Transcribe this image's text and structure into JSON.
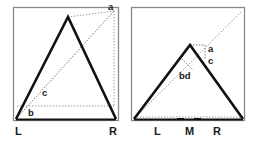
{
  "figure": {
    "width": 255,
    "height": 141,
    "background": "#ffffff",
    "stroke_bold": "#111111",
    "stroke_frame": "#8a8a8a",
    "stroke_dotted": "#9a9a9a"
  },
  "panels": [
    {
      "id": "left-panel",
      "name": "left-diagram-panel",
      "frame": {
        "x": 13,
        "y": 7,
        "width": 105,
        "height": 113
      },
      "bold_shape": "M16,119 L68,17 L116,119",
      "baseline": "M16,119 L116,119",
      "dotted_lines": [
        {
          "name": "diagonal-l-to-a",
          "d": "M16,119 L114,11"
        },
        {
          "name": "horizontal-b-level",
          "d": "M17,105 L114,105"
        },
        {
          "name": "vertical-right-edge",
          "d": "M114,11 L114,105"
        },
        {
          "name": "horizontal-top-a",
          "d": "M68,17 L114,11"
        }
      ],
      "point_labels": [
        {
          "name": "label-a",
          "text": "a",
          "x": 108,
          "y": 10
        },
        {
          "name": "label-c",
          "text": "c",
          "x": 42,
          "y": 96
        },
        {
          "name": "label-b",
          "text": "b",
          "x": 28,
          "y": 116
        }
      ],
      "axis_labels": [
        {
          "name": "axis-label-L",
          "text": "L",
          "x": 15,
          "y": 134
        },
        {
          "name": "axis-label-R",
          "text": "R",
          "x": 109,
          "y": 134
        }
      ],
      "ticks": []
    },
    {
      "id": "right-panel",
      "name": "right-diagram-panel",
      "frame": {
        "x": 131,
        "y": 7,
        "width": 114,
        "height": 113
      },
      "bold_shape": "M134,119 L190,45 L243,119",
      "baseline": "M134,119 L243,119",
      "dotted_lines": [
        {
          "name": "diagonal-l-to-corner",
          "d": "M134,119 L242,11"
        },
        {
          "name": "apex-box-vertical",
          "d": "M204,45 L204,59"
        },
        {
          "name": "apex-box-horizontal",
          "d": "M190,45 L204,45"
        },
        {
          "name": "bd-marker",
          "d": "M181,56 L192,68"
        }
      ],
      "point_labels": [
        {
          "name": "label-a",
          "text": "a",
          "x": 208,
          "y": 52
        },
        {
          "name": "label-c",
          "text": "c",
          "x": 208,
          "y": 64
        },
        {
          "name": "label-bd",
          "text": "bd",
          "x": 181,
          "y": 78
        }
      ],
      "axis_labels": [
        {
          "name": "axis-label-L",
          "text": "L",
          "x": 155,
          "y": 134
        },
        {
          "name": "axis-label-M",
          "text": "M",
          "x": 186,
          "y": 134
        },
        {
          "name": "axis-label-R",
          "text": "R",
          "x": 214,
          "y": 134
        }
      ],
      "ticks": [
        {
          "name": "tick-M",
          "d": "M178,119 L183,119"
        },
        {
          "name": "tick-R",
          "d": "M195,119 L200,119"
        }
      ]
    }
  ]
}
